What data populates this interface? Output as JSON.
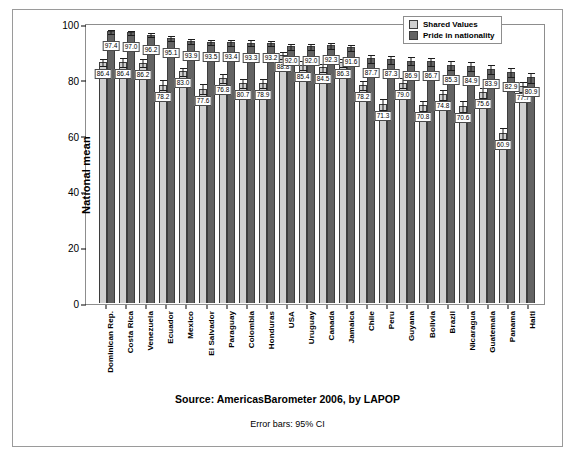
{
  "legend": {
    "items": [
      {
        "label": "Shared Values",
        "color": "#d0d0d0"
      },
      {
        "label": "Pride in nationality",
        "color": "#636363"
      }
    ]
  },
  "footer": {
    "source": "Source: AmericasBarometer 2006, by LAPOP",
    "error_note": "Error bars: 95% CI"
  },
  "chart_data": {
    "type": "bar",
    "title": "",
    "subtitle": "",
    "xlabel": "",
    "ylabel": "National mean",
    "ylim": [
      0,
      100
    ],
    "yticks": [
      0,
      20,
      40,
      60,
      80,
      100
    ],
    "grid": false,
    "legend_position": "top-right",
    "error_bars": "95% CI",
    "categories": [
      "Dominican Rep.",
      "Costa Rica",
      "Venezuela",
      "Ecuador",
      "Mexico",
      "El Salvador",
      "Paraguay",
      "Colombia",
      "Honduras",
      "USA",
      "Uruguay",
      "Canada",
      "Jamaica",
      "Chile",
      "Peru",
      "Guyana",
      "Bolivia",
      "Brazil",
      "Nicaragua",
      "Guatemala",
      "Panama",
      "Haiti"
    ],
    "series": [
      {
        "name": "Shared Values",
        "color": "#d0d0d0",
        "values": [
          86.4,
          86.4,
          86.2,
          78.2,
          83.0,
          76.8,
          80.7,
          78.9,
          78.9,
          88.8,
          85.4,
          84.5,
          86.3,
          78.2,
          71.3,
          79.0,
          70.8,
          74.8,
          70.6,
          75.6,
          60.9,
          77.7
        ],
        "errors": [
          1.6,
          1.7,
          1.7,
          2.0,
          1.6,
          2.0,
          1.8,
          1.9,
          1.9,
          1.5,
          1.8,
          1.6,
          1.7,
          1.9,
          2.1,
          1.9,
          2.0,
          2.0,
          2.1,
          2.0,
          2.2,
          2.0
        ]
      },
      {
        "name": "Pride in nationality",
        "color": "#636363",
        "values": [
          97.4,
          97.0,
          96.2,
          95.1,
          93.9,
          93.5,
          93.4,
          93.3,
          93.2,
          92.0,
          92.0,
          92.3,
          91.6,
          87.7,
          87.3,
          86.9,
          86.7,
          85.3,
          84.9,
          83.9,
          82.9,
          80.9
        ],
        "errors": [
          0.8,
          0.9,
          1.0,
          1.1,
          1.2,
          1.2,
          1.2,
          1.2,
          1.2,
          1.3,
          1.3,
          1.2,
          1.3,
          1.5,
          1.5,
          1.5,
          1.6,
          1.7,
          1.7,
          1.7,
          1.8,
          1.9
        ]
      }
    ],
    "value_labels": {
      "Dominican Rep.": {
        "Shared Values": "86.4",
        "Pride in nationality": "97.4"
      },
      "Costa Rica": {
        "Shared Values": "86.4",
        "Pride in nationality": "97.0"
      },
      "Venezuela": {
        "Shared Values": "86.2",
        "Pride in nationality": "96.2"
      },
      "Ecuador": {
        "Shared Values": "78.2",
        "Pride in nationality": "95.1"
      },
      "Mexico": {
        "Shared Values": "83.0",
        "Pride in nationality": "93.9"
      },
      "El Salvador": {
        "Shared Values": "77.6",
        "Pride in nationality": "93.5"
      },
      "Paraguay": {
        "Shared Values": "76.8",
        "Pride in nationality": "93.4"
      },
      "Colombia": {
        "Shared Values": "80.7",
        "Pride in nationality": "93.3"
      },
      "Honduras": {
        "Shared Values": "78.9",
        "Pride in nationality": "93.2"
      },
      "USA": {
        "Shared Values": "88.8",
        "Pride in nationality": "92.0"
      },
      "Uruguay": {
        "Shared Values": "85.4",
        "Pride in nationality": "92.0"
      },
      "Canada": {
        "Shared Values": "84.5",
        "Pride in nationality": "92.3"
      },
      "Jamaica": {
        "Shared Values": "86.3",
        "Pride in nationality": "91.6"
      },
      "Chile": {
        "Shared Values": "78.2",
        "Pride in nationality": "87.7"
      },
      "Peru": {
        "Shared Values": "71.3",
        "Pride in nationality": "87.3"
      },
      "Guyana": {
        "Shared Values": "79.0",
        "Pride in nationality": "86.9"
      },
      "Bolivia": {
        "Shared Values": "70.8",
        "Pride in nationality": "86.7"
      },
      "Brazil": {
        "Shared Values": "74.8",
        "Pride in nationality": "85.3"
      },
      "Nicaragua": {
        "Shared Values": "70.6",
        "Pride in nationality": "84.9"
      },
      "Guatemala": {
        "Shared Values": "75.6",
        "Pride in nationality": "83.9"
      },
      "Panama": {
        "Shared Values": "60.9",
        "Pride in nationality": "82.9"
      },
      "Haiti": {
        "Shared Values": "77.7",
        "Pride in nationality": "80.9"
      }
    }
  }
}
